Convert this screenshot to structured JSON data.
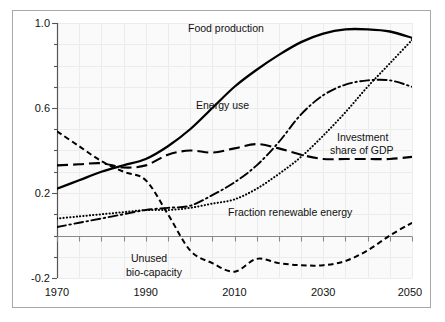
{
  "chart_data": {
    "type": "line",
    "title": "",
    "xlabel": "",
    "ylabel": "",
    "xlim": [
      1970,
      2050
    ],
    "ylim": [
      -0.2,
      1.0
    ],
    "xticks": [
      1970,
      1990,
      2010,
      2030,
      2050
    ],
    "yticks": [
      -0.2,
      0.2,
      0.6,
      1.0
    ],
    "ytick_labels": [
      "-0.2",
      "0.2",
      "0.6",
      "1.0"
    ],
    "xtick_labels": [
      "1970",
      "1990",
      "2010",
      "2030",
      "2050"
    ],
    "grid": true,
    "legend_position": "inline-annotations",
    "x": [
      1970,
      1975,
      1980,
      1985,
      1990,
      1995,
      2000,
      2005,
      2010,
      2015,
      2020,
      2025,
      2030,
      2035,
      2040,
      2045,
      2050
    ],
    "series": [
      {
        "name": "Food production",
        "style": "solid",
        "values": [
          0.22,
          0.26,
          0.3,
          0.33,
          0.36,
          0.42,
          0.5,
          0.6,
          0.7,
          0.78,
          0.85,
          0.91,
          0.95,
          0.97,
          0.97,
          0.96,
          0.93
        ]
      },
      {
        "name": "Energy use",
        "style": "dash-dot",
        "values": [
          0.04,
          0.06,
          0.08,
          0.1,
          0.12,
          0.13,
          0.14,
          0.19,
          0.25,
          0.33,
          0.44,
          0.57,
          0.66,
          0.71,
          0.73,
          0.73,
          0.7
        ]
      },
      {
        "name": "Investment share of GDP",
        "style": "dashed-long",
        "values": [
          0.33,
          0.335,
          0.34,
          0.32,
          0.33,
          0.38,
          0.4,
          0.39,
          0.41,
          0.43,
          0.41,
          0.38,
          0.36,
          0.36,
          0.36,
          0.36,
          0.37
        ]
      },
      {
        "name": "Fraction renewable energy",
        "style": "dotted",
        "values": [
          0.08,
          0.09,
          0.1,
          0.11,
          0.12,
          0.12,
          0.13,
          0.15,
          0.17,
          0.22,
          0.29,
          0.37,
          0.47,
          0.58,
          0.7,
          0.81,
          0.92
        ]
      },
      {
        "name": "Unused bio-capacity",
        "style": "dashed-short",
        "values": [
          0.49,
          0.42,
          0.35,
          0.3,
          0.26,
          0.1,
          -0.07,
          -0.13,
          -0.17,
          -0.11,
          -0.13,
          -0.14,
          -0.14,
          -0.12,
          -0.07,
          0.0,
          0.06
        ]
      }
    ],
    "annotations": [
      {
        "text": "Food production",
        "x": 2005,
        "y": 0.97,
        "name": "food-production-label"
      },
      {
        "text": "Energy use",
        "x": 2003,
        "y": 0.6,
        "name": "energy-use-label"
      },
      {
        "text": "Investment",
        "x": 2034,
        "y": 0.45,
        "name": "investment-label-line1"
      },
      {
        "text": "share of GDP",
        "x": 2034,
        "y": 0.38,
        "name": "investment-label-line2"
      },
      {
        "text": "Fraction renewable energy",
        "x": 2014,
        "y": 0.16,
        "name": "fraction-renewable-label"
      },
      {
        "text": "Unused",
        "x": 1998,
        "y": -0.12,
        "name": "unused-biocapacity-label-line1"
      },
      {
        "text": "bio-capacity",
        "x": 1998,
        "y": -0.17,
        "name": "unused-biocapacity-label-line2"
      }
    ],
    "colors": {
      "line": "#000000",
      "grid": "#e9e9e9",
      "axis": "#555555",
      "background": "#fafafa",
      "border": "#a8a8a8",
      "text": "#111111"
    }
  },
  "labels": {
    "food_production": "Food production",
    "energy_use": "Energy use",
    "investment_line1": "Investment",
    "investment_line2": "share of GDP",
    "fraction_renewable": "Fraction renewable energy",
    "unused_line1": "Unused",
    "unused_line2": "bio-capacity"
  },
  "axes": {
    "y": {
      "t0": "1.0",
      "t1": "0.6",
      "t2": "0.2",
      "t3": "-0.2"
    },
    "x": {
      "t0": "1970",
      "t1": "1990",
      "t2": "2010",
      "t3": "2030",
      "t4": "2050"
    }
  }
}
